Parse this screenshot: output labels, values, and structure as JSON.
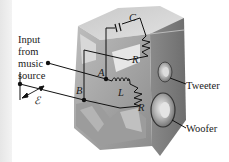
{
  "diagram": {
    "input_label": [
      "Input",
      "from",
      "music",
      "source"
    ],
    "emf_symbol": "ℰ",
    "nodes": {
      "A": "A",
      "B": "B"
    },
    "components": {
      "capacitor": "C",
      "resistor_top": "R",
      "inductor": "L",
      "resistor_bottom": "R"
    },
    "speakers": {
      "tweeter": "Tweeter",
      "woofer": "Woofer"
    },
    "colors": {
      "background": "#ffffff",
      "box_light": "#d6d6d6",
      "box_mid": "#a8a8a8",
      "box_dark": "#7a7a7a",
      "wire": "#111111"
    }
  }
}
